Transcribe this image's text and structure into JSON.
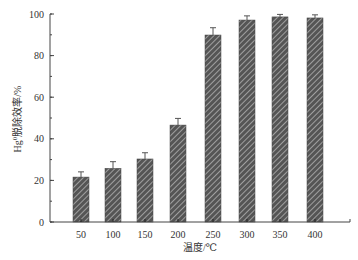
{
  "chart_data": {
    "type": "bar",
    "title": "",
    "xlabel": "温度/℃",
    "ylabel": "Hg⁰脱除效率/%",
    "ylabel_parts": {
      "prefix": "Hg",
      "sup": "0",
      "suffix": "脱除效率/%"
    },
    "categories": [
      "50",
      "100",
      "150",
      "200",
      "250",
      "300",
      "350",
      "400"
    ],
    "values": [
      21.6,
      25.8,
      30.3,
      46.6,
      89.9,
      97.1,
      98.6,
      98.1
    ],
    "errors": [
      2.5,
      3.2,
      3.0,
      3.2,
      3.5,
      2.0,
      1.2,
      1.5
    ],
    "ylim": [
      0,
      100
    ],
    "yticks": [
      0,
      20,
      40,
      60,
      80,
      100
    ],
    "yminor_step": 10,
    "grid": false,
    "legend": null,
    "bar_style": {
      "fill": "#555555",
      "hatch": "diagonal",
      "hatch_color": "#c8c8c8"
    }
  }
}
